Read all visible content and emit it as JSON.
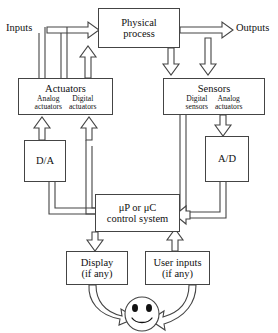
{
  "diagram": {
    "stroke_color": "#444444",
    "background_color": "#ffffff"
  },
  "labels": {
    "inputs": "Inputs",
    "outputs": "Outputs"
  },
  "blocks": {
    "physical_process": {
      "line1": "Physical",
      "line2": "process"
    },
    "actuators": {
      "title": "Actuators",
      "left_sub_line1": "Analog",
      "left_sub_line2": "actuators",
      "right_sub_line1": "Digital",
      "right_sub_line2": "actuators"
    },
    "sensors": {
      "title": "Sensors",
      "left_sub_line1": "Digital",
      "left_sub_line2": "sensors",
      "right_sub_line1": "Analog",
      "right_sub_line2": "actuators"
    },
    "da_converter": {
      "label": "D/A"
    },
    "ad_converter": {
      "label": "A/D"
    },
    "control_system": {
      "line1": "μP or μC",
      "line2": "control system"
    },
    "display": {
      "line1": "Display",
      "line2": "(if any)"
    },
    "user_inputs": {
      "line1": "User inputs",
      "line2": "(if any)"
    },
    "user": {
      "icon": "smiley-face"
    }
  }
}
